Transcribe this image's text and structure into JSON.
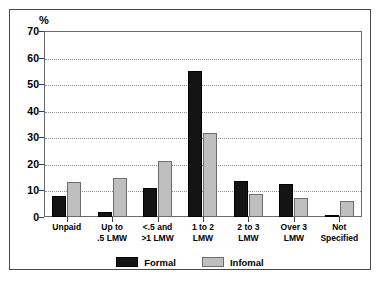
{
  "chart_data": {
    "type": "bar",
    "title": "",
    "subtitle": "",
    "xlabel": "",
    "ylabel": "%",
    "ylim": [
      0,
      70
    ],
    "ytick_step": 10,
    "yticks": [
      "70",
      "60",
      "50",
      "40",
      "30",
      "20",
      "10",
      "0"
    ],
    "grid": true,
    "grid_style": "dotted-horizontal",
    "legend_position": "bottom-center",
    "categories": [
      "Unpaid",
      "Up to\n.5 LMW",
      "<.5 and\n>1 LMW",
      "1 to 2\nLMW",
      "2 to 3\nLMW",
      "Over 3\nLMW",
      "Not\nSpecified"
    ],
    "series": [
      {
        "name": "Formal",
        "color": "#141414",
        "values": [
          8,
          2,
          11,
          55,
          13.5,
          12.5,
          0.3
        ]
      },
      {
        "name": "Infomal",
        "color": "#bfbfbf",
        "values": [
          13,
          14.5,
          21,
          31.5,
          8.5,
          7,
          6
        ]
      }
    ]
  },
  "figure": {
    "unit_label": "%"
  },
  "legend": {
    "entries": [
      {
        "label": "Formal",
        "swatch": "black-swatch-icon"
      },
      {
        "label": "Infomal",
        "swatch": "gray-swatch-icon"
      }
    ]
  }
}
